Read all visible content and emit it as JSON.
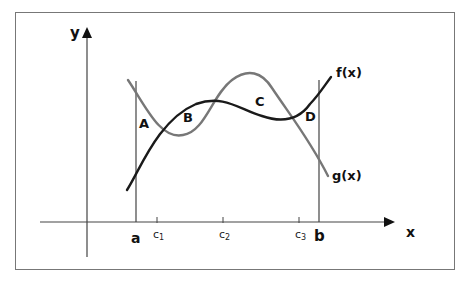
{
  "diagram": {
    "axes": {
      "x_label": "x",
      "y_label": "y"
    },
    "bounds": {
      "left_label": "a",
      "right_label": "b"
    },
    "points": [
      {
        "base": "c",
        "sub": "1"
      },
      {
        "base": "c",
        "sub": "2"
      },
      {
        "base": "c",
        "sub": "3"
      }
    ],
    "curves": [
      {
        "name": "f(x)",
        "color": "#1a1a1a"
      },
      {
        "name": "g(x)",
        "color": "#777777"
      }
    ],
    "regions": [
      "A",
      "B",
      "C",
      "D"
    ],
    "colors": {
      "frame": "#777777",
      "axis": "#444444",
      "f": "#1a1a1a",
      "g": "#777777"
    }
  }
}
